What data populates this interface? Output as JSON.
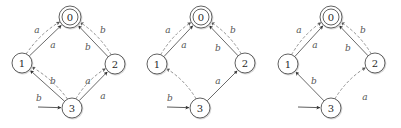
{
  "colors": {
    "node_stroke": "#3a3a3a",
    "solid_edge": "#444444",
    "dashed_edge": "#777777",
    "label": "#555555"
  },
  "automata": [
    {
      "id": "automaton-1",
      "nodes": [
        {
          "id": "0",
          "label": "0",
          "x": 70,
          "y": 17,
          "accepting": true
        },
        {
          "id": "1",
          "label": "1",
          "x": 22,
          "y": 63,
          "accepting": false
        },
        {
          "id": "2",
          "label": "2",
          "x": 115,
          "y": 64,
          "accepting": false
        },
        {
          "id": "3",
          "label": "3",
          "x": 72,
          "y": 108,
          "accepting": false,
          "initial": true
        }
      ],
      "initial_from": [
        38,
        107
      ],
      "edges": [
        {
          "from": "1",
          "to": "0",
          "label": "a",
          "style": "solid",
          "bend": 0,
          "lx": 53,
          "ly": 45
        },
        {
          "from": "1",
          "to": "0",
          "label": "a",
          "style": "dashed",
          "bend": -1,
          "lx": 37,
          "ly": 30
        },
        {
          "from": "2",
          "to": "0",
          "label": "b",
          "style": "solid",
          "bend": 0,
          "lx": 88,
          "ly": 47
        },
        {
          "from": "2",
          "to": "0",
          "label": "b",
          "style": "dashed",
          "bend": 1,
          "lx": 103,
          "ly": 30
        },
        {
          "from": "3",
          "to": "1",
          "label": "b",
          "style": "solid",
          "bend": 0,
          "lx": 53,
          "ly": 81
        },
        {
          "from": "3",
          "to": "1",
          "label": "b",
          "style": "dashed",
          "bend": 1,
          "lx": 39,
          "ly": 98
        },
        {
          "from": "3",
          "to": "2",
          "label": "a",
          "style": "solid",
          "bend": 0,
          "lx": 88,
          "ly": 81
        },
        {
          "from": "3",
          "to": "2",
          "label": "a",
          "style": "dashed",
          "bend": -1,
          "lx": 103,
          "ly": 96
        }
      ]
    },
    {
      "id": "automaton-2",
      "nodes": [
        {
          "id": "0",
          "label": "0",
          "x": 201,
          "y": 17,
          "accepting": true
        },
        {
          "id": "1",
          "label": "1",
          "x": 157,
          "y": 64,
          "accepting": false
        },
        {
          "id": "2",
          "label": "2",
          "x": 245,
          "y": 63,
          "accepting": false
        },
        {
          "id": "3",
          "label": "3",
          "x": 200,
          "y": 108,
          "accepting": false,
          "initial": true
        }
      ],
      "initial_from": [
        167,
        107
      ],
      "edges": [
        {
          "from": "1",
          "to": "0",
          "label": "a",
          "style": "solid",
          "bend": 0,
          "lx": 184,
          "ly": 45
        },
        {
          "from": "1",
          "to": "0",
          "label": "a",
          "style": "dashed",
          "bend": -1,
          "lx": 168,
          "ly": 30
        },
        {
          "from": "2",
          "to": "0",
          "label": "b",
          "style": "solid",
          "bend": 0,
          "lx": 218,
          "ly": 48
        },
        {
          "from": "2",
          "to": "0",
          "label": "b",
          "style": "dashed",
          "bend": 1,
          "lx": 233,
          "ly": 30
        },
        {
          "from": "3",
          "to": "1",
          "label": "b",
          "style": "dashed",
          "bend": 1,
          "lx": 170,
          "ly": 98
        },
        {
          "from": "3",
          "to": "2",
          "label": "a",
          "style": "solid",
          "bend": 0,
          "lx": 218,
          "ly": 81
        }
      ]
    },
    {
      "id": "automaton-3",
      "nodes": [
        {
          "id": "0",
          "label": "0",
          "x": 331,
          "y": 17,
          "accepting": true
        },
        {
          "id": "1",
          "label": "1",
          "x": 288,
          "y": 64,
          "accepting": false
        },
        {
          "id": "2",
          "label": "2",
          "x": 375,
          "y": 63,
          "accepting": false
        },
        {
          "id": "3",
          "label": "3",
          "x": 331,
          "y": 108,
          "accepting": false,
          "initial": true
        }
      ],
      "initial_from": [
        298,
        107
      ],
      "edges": [
        {
          "from": "1",
          "to": "0",
          "label": "a",
          "style": "solid",
          "bend": 0,
          "lx": 315,
          "ly": 45
        },
        {
          "from": "1",
          "to": "0",
          "label": "a",
          "style": "dashed",
          "bend": -1,
          "lx": 299,
          "ly": 30
        },
        {
          "from": "2",
          "to": "0",
          "label": "b",
          "style": "solid",
          "bend": 0,
          "lx": 348,
          "ly": 48
        },
        {
          "from": "2",
          "to": "0",
          "label": "b",
          "style": "dashed",
          "bend": 1,
          "lx": 363,
          "ly": 30
        },
        {
          "from": "3",
          "to": "1",
          "label": "b",
          "style": "solid",
          "bend": 0,
          "lx": 314,
          "ly": 81
        },
        {
          "from": "3",
          "to": "2",
          "label": "a",
          "style": "dashed",
          "bend": -1,
          "lx": 365,
          "ly": 97
        }
      ]
    }
  ]
}
